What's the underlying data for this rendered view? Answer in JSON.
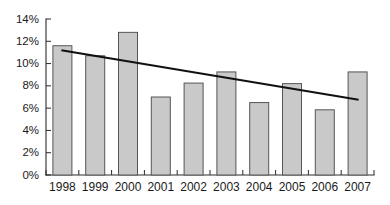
{
  "chart_data": {
    "type": "bar",
    "title": "",
    "subtitle": "",
    "xlabel": "",
    "ylabel": "",
    "categories": [
      "1998",
      "1999",
      "2000",
      "2001",
      "2002",
      "2003",
      "2004",
      "2005",
      "2006",
      "2007"
    ],
    "values": [
      11.6,
      10.7,
      12.8,
      7.0,
      8.25,
      9.25,
      6.5,
      8.2,
      5.85,
      9.25
    ],
    "value_suffix": "%",
    "ylim": [
      0,
      14
    ],
    "ytick_values": [
      0,
      2,
      4,
      6,
      8,
      10,
      12,
      14
    ],
    "ytick_labels": [
      "0%",
      "2%",
      "4%",
      "6%",
      "8%",
      "10%",
      "12%",
      "14%"
    ],
    "grid": false,
    "legend": false,
    "legend_position": "none",
    "series": [
      {
        "name": "bars",
        "type": "bar",
        "values": [
          11.6,
          10.7,
          12.8,
          7.0,
          8.25,
          9.25,
          6.5,
          8.2,
          5.85,
          9.25
        ]
      },
      {
        "name": "trend-line",
        "type": "line",
        "annotation": "linear trend",
        "x_start_category": "1998",
        "x_end_category": "2007",
        "y_start": 11.2,
        "y_end": 6.75
      }
    ],
    "colors": {
      "bar_fill": "#c9c9c9",
      "bar_stroke": "#555555",
      "trend_line": "#101010",
      "axis": "#2a2a2a",
      "tick_label": "#1a1a1a",
      "background": "#ffffff"
    }
  }
}
